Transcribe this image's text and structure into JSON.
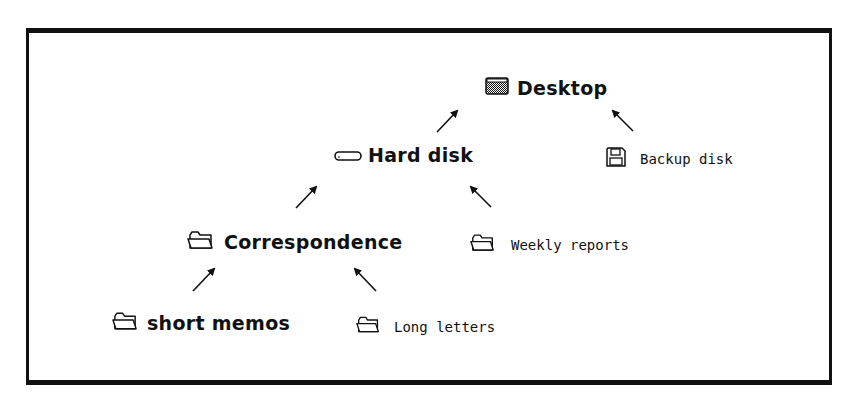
{
  "diagram": {
    "type": "folder-hierarchy",
    "nodes": [
      {
        "id": "desktop",
        "label": "Desktop",
        "icon": "desktop-icon",
        "emphasis": "bold"
      },
      {
        "id": "hard_disk",
        "label": "Hard disk",
        "icon": "hard-disk-icon",
        "emphasis": "bold"
      },
      {
        "id": "backup_disk",
        "label": "Backup disk",
        "icon": "floppy-disk-icon",
        "emphasis": "plain"
      },
      {
        "id": "correspondence",
        "label": "Correspondence",
        "icon": "folder-icon",
        "emphasis": "bold"
      },
      {
        "id": "weekly_reports",
        "label": "Weekly reports",
        "icon": "folder-icon",
        "emphasis": "plain"
      },
      {
        "id": "short_memos",
        "label": "short memos",
        "icon": "folder-icon",
        "emphasis": "bold"
      },
      {
        "id": "long_letters",
        "label": "Long letters",
        "icon": "folder-icon",
        "emphasis": "plain"
      }
    ],
    "edges": [
      {
        "from": "hard_disk",
        "to": "desktop"
      },
      {
        "from": "backup_disk",
        "to": "desktop"
      },
      {
        "from": "correspondence",
        "to": "hard_disk"
      },
      {
        "from": "weekly_reports",
        "to": "hard_disk"
      },
      {
        "from": "short_memos",
        "to": "correspondence"
      },
      {
        "from": "long_letters",
        "to": "correspondence"
      }
    ]
  },
  "labels": {
    "desktop": "Desktop",
    "hard_disk": "Hard disk",
    "backup_disk": "Backup disk",
    "correspondence": "Correspondence",
    "weekly_reports": "Weekly reports",
    "short_memos": "short memos",
    "long_letters": "Long letters"
  }
}
